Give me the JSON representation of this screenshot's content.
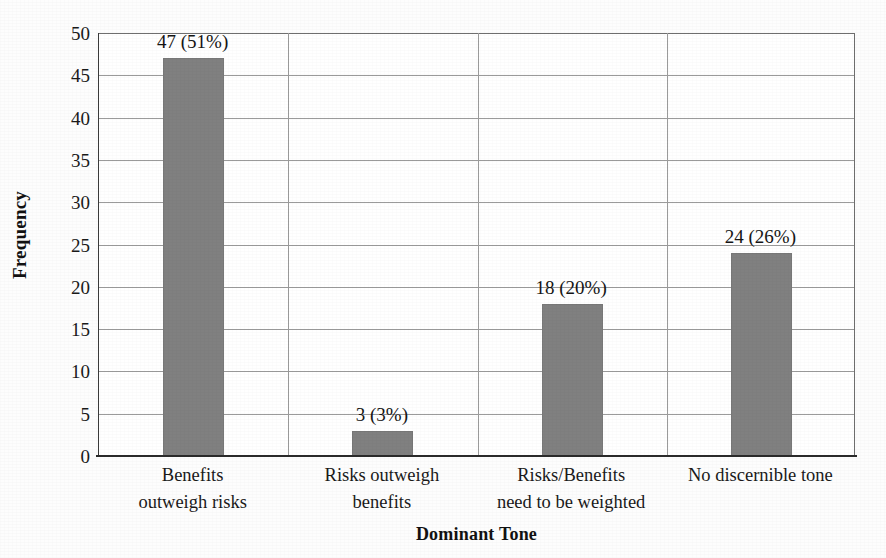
{
  "chart_data": {
    "type": "bar",
    "title": "",
    "xlabel": "Dominant Tone",
    "ylabel": "Frequency",
    "categories": [
      "Benefits outweigh risks",
      "Risks outweigh benefits",
      "Risks/Benefits need to be weighted",
      "No discernible tone"
    ],
    "category_lines": [
      [
        "Benefits",
        "outweigh risks"
      ],
      [
        "Risks outweigh",
        "benefits"
      ],
      [
        "Risks/Benefits",
        "need to be weighted"
      ],
      [
        "No discernible tone",
        ""
      ]
    ],
    "values": [
      47,
      3,
      18,
      24
    ],
    "percentages": [
      51,
      3,
      20,
      26
    ],
    "data_labels": [
      "47 (51%)",
      "3 (3%)",
      "18 (20%)",
      "24 (26%)"
    ],
    "ylim": [
      0,
      50
    ],
    "ytick_labels": [
      "50",
      "45",
      "40",
      "35",
      "30",
      "25",
      "20",
      "15",
      "10",
      "5",
      "0"
    ],
    "ytick_values": [
      50,
      45,
      40,
      35,
      30,
      25,
      20,
      15,
      10,
      5,
      0
    ],
    "ytick_step": 5,
    "grid": true,
    "grid_orientation": "both",
    "legend": "none",
    "bar_color": "#808080",
    "gridline_color": "#9b9b9b",
    "axis_color": "#2b2b2b",
    "text_color": "#1a1a1a",
    "background_color": "#ffffff"
  }
}
